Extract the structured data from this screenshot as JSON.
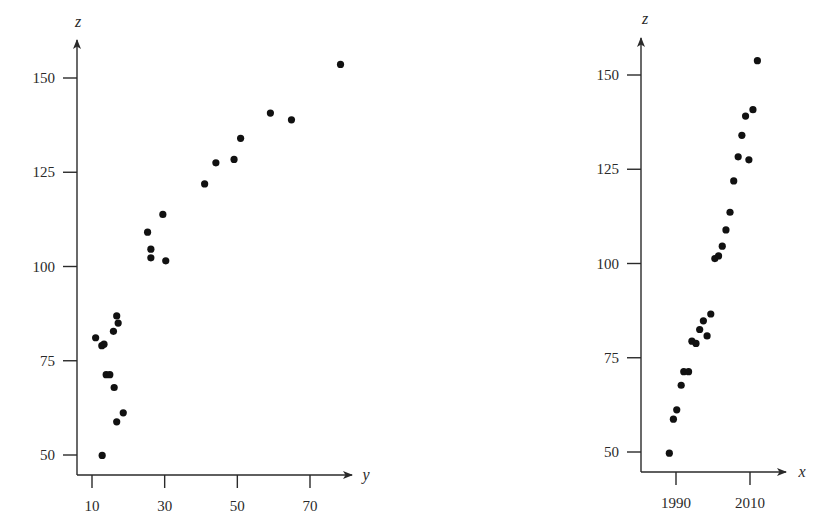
{
  "figure": {
    "title": "Scatter plots of z versus y and z versus x"
  },
  "chart_data": [
    {
      "type": "scatter",
      "title": "",
      "xlabel": "y",
      "ylabel": "z",
      "xlim": [
        5,
        80
      ],
      "ylim": [
        45,
        160
      ],
      "xticks": [
        10,
        30,
        50,
        70
      ],
      "yticks": [
        50,
        75,
        100,
        125,
        150
      ],
      "grid": false,
      "legend": null,
      "points": [
        {
          "x": 78.4,
          "y": 153.6
        },
        {
          "x": 59.1,
          "y": 140.7
        },
        {
          "x": 64.9,
          "y": 138.9
        },
        {
          "x": 50.9,
          "y": 134.0
        },
        {
          "x": 44.1,
          "y": 127.5
        },
        {
          "x": 49.1,
          "y": 128.4
        },
        {
          "x": 41.0,
          "y": 121.9
        },
        {
          "x": 29.5,
          "y": 113.8
        },
        {
          "x": 25.3,
          "y": 109.1
        },
        {
          "x": 26.2,
          "y": 104.6
        },
        {
          "x": 26.2,
          "y": 102.3
        },
        {
          "x": 30.3,
          "y": 101.5
        },
        {
          "x": 16.8,
          "y": 86.9
        },
        {
          "x": 17.2,
          "y": 85.0
        },
        {
          "x": 15.9,
          "y": 82.8
        },
        {
          "x": 11.0,
          "y": 81.1
        },
        {
          "x": 12.7,
          "y": 79.0
        },
        {
          "x": 13.3,
          "y": 79.4
        },
        {
          "x": 13.9,
          "y": 71.3
        },
        {
          "x": 14.9,
          "y": 71.3
        },
        {
          "x": 16.1,
          "y": 67.9
        },
        {
          "x": 18.6,
          "y": 61.2
        },
        {
          "x": 16.8,
          "y": 58.8
        },
        {
          "x": 12.8,
          "y": 49.9
        }
      ]
    },
    {
      "type": "scatter",
      "title": "",
      "xlabel": "x",
      "ylabel": "z",
      "xlim": [
        1980,
        2018
      ],
      "ylim": [
        45,
        160
      ],
      "xticks": [
        1990,
        2010
      ],
      "yticks": [
        50,
        75,
        100,
        125,
        150
      ],
      "grid": false,
      "legend": null,
      "points": [
        {
          "x": 2012.0,
          "y": 153.8
        },
        {
          "x": 2010.8,
          "y": 140.8
        },
        {
          "x": 2008.8,
          "y": 139.1
        },
        {
          "x": 2007.8,
          "y": 134.0
        },
        {
          "x": 2006.8,
          "y": 128.3
        },
        {
          "x": 2009.7,
          "y": 127.5
        },
        {
          "x": 2005.6,
          "y": 121.9
        },
        {
          "x": 2004.6,
          "y": 113.6
        },
        {
          "x": 2003.5,
          "y": 108.9
        },
        {
          "x": 2002.5,
          "y": 104.6
        },
        {
          "x": 2001.5,
          "y": 102.0
        },
        {
          "x": 2000.5,
          "y": 101.3
        },
        {
          "x": 1999.4,
          "y": 86.6
        },
        {
          "x": 1997.4,
          "y": 84.8
        },
        {
          "x": 1996.4,
          "y": 82.5
        },
        {
          "x": 1998.4,
          "y": 80.8
        },
        {
          "x": 1994.3,
          "y": 79.4
        },
        {
          "x": 1995.4,
          "y": 78.8
        },
        {
          "x": 1992.1,
          "y": 71.3
        },
        {
          "x": 1993.4,
          "y": 71.3
        },
        {
          "x": 1991.4,
          "y": 67.7
        },
        {
          "x": 1990.2,
          "y": 61.2
        },
        {
          "x": 1989.3,
          "y": 58.7
        },
        {
          "x": 1988.2,
          "y": 49.7
        }
      ]
    }
  ],
  "layout": {
    "panels": [
      {
        "axis_origin_px": [
          77,
          475
        ],
        "y_axis_top_px": 40,
        "x_axis_end_px": 352,
        "x_map": {
          "v0": 10,
          "px0": 92,
          "v1": 70,
          "px1": 310
        },
        "y_map": {
          "v0": 50,
          "px0": 455,
          "v1": 150,
          "px1": 78
        },
        "xlabel_pos": [
          366,
          480
        ],
        "ylabel_pos": [
          78,
          27
        ]
      },
      {
        "axis_origin_px": [
          641,
          472
        ],
        "y_axis_top_px": 38,
        "x_axis_end_px": 786,
        "x_map": {
          "v0": 1990,
          "px0": 676,
          "v1": 2010,
          "px1": 750
        },
        "y_map": {
          "v0": 50,
          "px0": 452,
          "v1": 150,
          "px1": 75
        },
        "xlabel_pos": [
          802,
          477
        ],
        "ylabel_pos": [
          645,
          24
        ]
      }
    ]
  }
}
